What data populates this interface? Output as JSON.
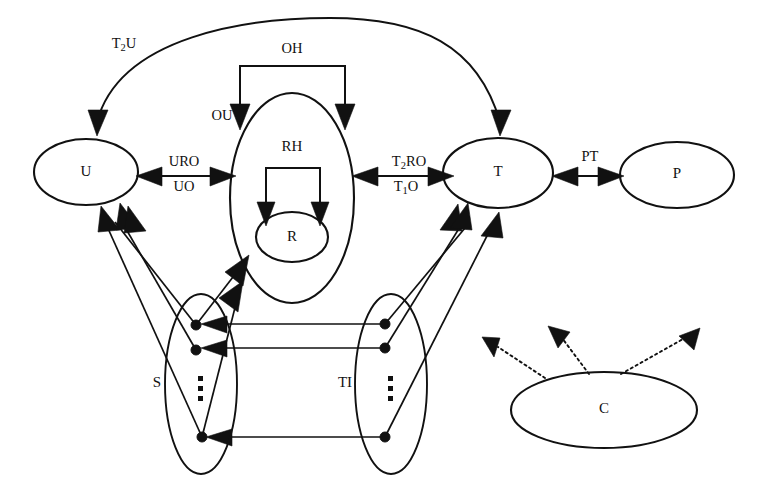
{
  "diagram": {
    "background_color": "#ffffff",
    "stroke_color": "#111111",
    "nodes": [
      {
        "id": "U",
        "label": "U",
        "shape": "ellipse",
        "cx": 86,
        "cy": 172,
        "rx": 52,
        "ry": 33
      },
      {
        "id": "RH",
        "label": "RH",
        "shape": "ellipse",
        "cx": 292,
        "cy": 198,
        "rx": 62,
        "ry": 105
      },
      {
        "id": "R",
        "label": "R",
        "shape": "ellipse",
        "cx": 292,
        "cy": 237,
        "rx": 36,
        "ry": 25
      },
      {
        "id": "T",
        "label": "T",
        "shape": "ellipse",
        "cx": 498,
        "cy": 173,
        "rx": 55,
        "ry": 35
      },
      {
        "id": "P",
        "label": "P",
        "shape": "ellipse",
        "cx": 677,
        "cy": 175,
        "rx": 57,
        "ry": 33
      },
      {
        "id": "S",
        "label": "S",
        "shape": "ellipse",
        "cx": 201,
        "cy": 384,
        "rx": 36,
        "ry": 90
      },
      {
        "id": "TI",
        "label": "TI",
        "shape": "ellipse",
        "cx": 391,
        "cy": 384,
        "rx": 36,
        "ry": 90
      },
      {
        "id": "C",
        "label": "C",
        "shape": "ellipse",
        "cx": 604,
        "cy": 410,
        "rx": 93,
        "ry": 38
      }
    ],
    "node_label_offsets": {
      "RH": {
        "x": 292,
        "y": 148
      },
      "S": {
        "x": 157,
        "y": 384
      },
      "TI": {
        "x": 345,
        "y": 384
      }
    },
    "edge_labels": [
      {
        "id": "T2U",
        "text_main": "T",
        "text_sub": "2",
        "text_tail": "U",
        "x": 124,
        "y": 45
      },
      {
        "id": "OH",
        "text_main": "OH",
        "text_sub": "",
        "text_tail": "",
        "x": 292,
        "y": 50
      },
      {
        "id": "OU",
        "text_main": "OU",
        "text_sub": "",
        "text_tail": "",
        "x": 222,
        "y": 117
      },
      {
        "id": "URO",
        "text_main": "URO",
        "text_sub": "",
        "text_tail": "",
        "x": 184,
        "y": 163
      },
      {
        "id": "UO",
        "text_main": "UO",
        "text_sub": "",
        "text_tail": "",
        "x": 184,
        "y": 187
      },
      {
        "id": "T2RO",
        "text_main": "T",
        "text_sub": "2",
        "text_tail": "RO",
        "x": 409,
        "y": 163
      },
      {
        "id": "T1O",
        "text_main": "T",
        "text_sub": "1",
        "text_tail": "O",
        "x": 406,
        "y": 187
      },
      {
        "id": "PT",
        "text_main": "PT",
        "text_sub": "",
        "text_tail": "",
        "x": 590,
        "y": 158
      }
    ],
    "ellipsis_groups": [
      {
        "id": "s-ellipsis",
        "x": 201,
        "y": 388
      },
      {
        "id": "ti-ellipsis",
        "x": 391,
        "y": 388
      }
    ],
    "s_ports": [
      {
        "id": "s-port-1",
        "cx": 196,
        "cy": 325
      },
      {
        "id": "s-port-2",
        "cx": 196,
        "cy": 350
      },
      {
        "id": "s-port-3",
        "cx": 202,
        "cy": 437
      }
    ],
    "ti_ports": [
      {
        "id": "ti-port-1",
        "cx": 385,
        "cy": 324
      },
      {
        "id": "ti-port-2",
        "cx": 385,
        "cy": 348
      },
      {
        "id": "ti-port-3",
        "cx": 385,
        "cy": 437
      }
    ],
    "legend_note": "Directed graph of U, RH, R, T, P, S, TI and C components"
  }
}
